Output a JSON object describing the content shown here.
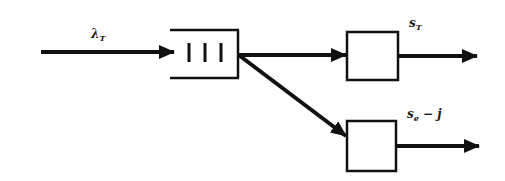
{
  "diagram": {
    "type": "queueing-network",
    "colors": {
      "stroke": "#111111",
      "background": "#ffffff"
    },
    "input": {
      "label_main": "λ",
      "label_sub": "T"
    },
    "queue": {
      "name": "buffer",
      "bars": 3
    },
    "servers": [
      {
        "id": "server-1",
        "output_label_main": "s",
        "output_label_sub": "T",
        "output_label_suffix": ""
      },
      {
        "id": "server-2",
        "output_label_main": "s",
        "output_label_sub": "e",
        "output_label_suffix": " − j"
      }
    ],
    "edges": [
      {
        "from": "input",
        "to": "queue"
      },
      {
        "from": "queue",
        "to": "server-1"
      },
      {
        "from": "queue",
        "to": "server-2"
      },
      {
        "from": "server-1",
        "to": "output-1"
      },
      {
        "from": "server-2",
        "to": "output-2"
      }
    ]
  }
}
